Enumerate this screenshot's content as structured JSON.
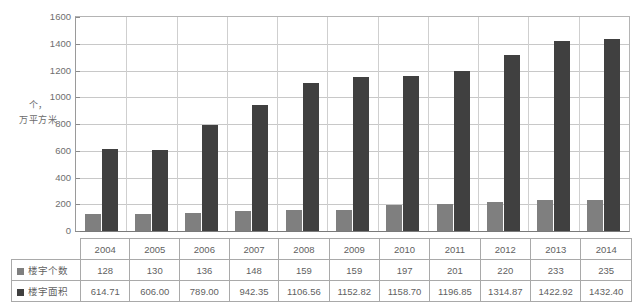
{
  "chart_data": {
    "type": "bar",
    "title": "",
    "subtitle": "",
    "xlabel": "",
    "ylabel": "个，万平方米",
    "ylim": [
      0,
      1600
    ],
    "ytick_step": 200,
    "yticks": [
      "0",
      "200",
      "400",
      "600",
      "800",
      "1000",
      "1200",
      "1400",
      "1600"
    ],
    "grid": true,
    "legend_position": "table",
    "categories": [
      "2004",
      "2005",
      "2006",
      "2007",
      "2008",
      "2009",
      "2010",
      "2011",
      "2012",
      "2013",
      "2014"
    ],
    "series": [
      {
        "name": "楼宇个数",
        "color": "#7f7f7f",
        "values": [
          128,
          130,
          136,
          148,
          159,
          159,
          197,
          201,
          220,
          233,
          235
        ],
        "display_values": [
          "128",
          "130",
          "136",
          "148",
          "159",
          "159",
          "197",
          "201",
          "220",
          "233",
          "235"
        ]
      },
      {
        "name": "楼宇面积",
        "color": "#404040",
        "values": [
          614.71,
          606.0,
          789.0,
          942.35,
          1106.56,
          1152.82,
          1158.7,
          1196.85,
          1314.87,
          1422.92,
          1432.4
        ],
        "display_values": [
          "614.71",
          "606.00",
          "789.00",
          "942.35",
          "1106.56",
          "1152.82",
          "1158.70",
          "1196.85",
          "1314.87",
          "1422.92",
          "1432.40"
        ]
      }
    ]
  },
  "axis": {
    "unit_line1": "个，",
    "unit_line2": "万平方米"
  },
  "colors": {
    "series_count": "#7f7f7f",
    "series_area": "#404040",
    "gridline": "#c8c8c8",
    "axis": "#8a8a8a",
    "table_border": "#a9a9a9",
    "text": "#5f5f5f"
  }
}
